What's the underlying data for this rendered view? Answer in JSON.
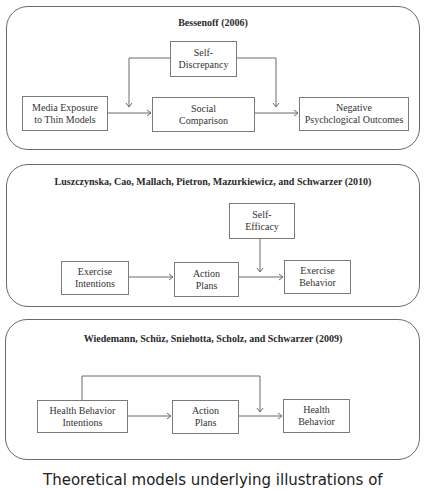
{
  "panels": [
    {
      "title": "Bessenoff (2006)",
      "boxes": {
        "self_discrepancy": [
          "Self-",
          "Discrepancy"
        ],
        "media_exposure": [
          "Media Exposure",
          "to Thin Models"
        ],
        "social_comparison": [
          "Social",
          "Comparison"
        ],
        "negative_outcomes": [
          "Negative",
          "Psychclogical Outcomes"
        ]
      }
    },
    {
      "title": "Luszczynska, Cao, Mallach, Pietron, Mazurkiewicz, and Schwarzer (2010)",
      "boxes": {
        "self_efficacy": [
          "Self-",
          "Efficacy"
        ],
        "exercise_intentions": [
          "Exercise",
          "Intentions"
        ],
        "action_plans": [
          "Action",
          "Plans"
        ],
        "exercise_behavior": [
          "Exercise",
          "Behavior"
        ]
      }
    },
    {
      "title": "Wiedemann, Schüz, Sniehotta, Scholz, and Schwarzer (2009)",
      "boxes": {
        "health_behavior_intentions": [
          "Health Behavior",
          "Intentions"
        ],
        "action_plans": [
          "Action",
          "Plans"
        ],
        "health_behavior": [
          "Health",
          "Behavior"
        ]
      }
    }
  ],
  "caption": "Theoretical models underlying illustrations of",
  "colors": {
    "stroke": "#6a6a6a",
    "text": "#333333"
  }
}
